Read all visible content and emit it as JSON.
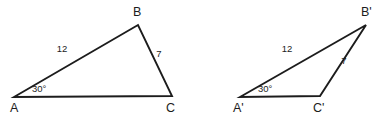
{
  "figure": {
    "background_color": "#ffffff",
    "stroke_color": "#1c1c1c",
    "width": 383,
    "height": 118,
    "triangles": [
      {
        "id": "triangle-abc",
        "name": "ABC",
        "vertices": [
          {
            "name": "A",
            "label": "A",
            "x": 14,
            "y": 97,
            "label_x": 10,
            "label_y": 112
          },
          {
            "name": "B",
            "label": "B",
            "x": 138,
            "y": 25,
            "label_x": 133,
            "label_y": 16
          },
          {
            "name": "C",
            "label": "C",
            "x": 172,
            "y": 96,
            "label_x": 166,
            "label_y": 112
          }
        ],
        "sides": [
          {
            "name": "AB",
            "label": "12",
            "label_x": 62,
            "label_y": 52
          },
          {
            "name": "BC",
            "label": "7",
            "label_x": 159,
            "label_y": 57
          }
        ],
        "angles": [
          {
            "at": "A",
            "label": "30°",
            "label_x": 32,
            "label_y": 92
          }
        ]
      },
      {
        "id": "triangle-abc-prime",
        "name": "A'B'C'",
        "vertices": [
          {
            "name": "A-prime",
            "label": "A'",
            "x": 240,
            "y": 97,
            "label_x": 233,
            "label_y": 112
          },
          {
            "name": "B-prime",
            "label": "B'",
            "x": 366,
            "y": 25,
            "label_x": 361,
            "label_y": 16
          },
          {
            "name": "C-prime",
            "label": "C'",
            "x": 320,
            "y": 96,
            "label_x": 313,
            "label_y": 112
          }
        ],
        "sides": [
          {
            "name": "A'B'",
            "label": "12",
            "label_x": 287,
            "label_y": 52
          },
          {
            "name": "B'C'",
            "label": "7",
            "label_x": 344,
            "label_y": 64
          }
        ],
        "angles": [
          {
            "at": "A-prime",
            "label": "30°",
            "label_x": 258,
            "label_y": 92
          }
        ]
      }
    ]
  }
}
